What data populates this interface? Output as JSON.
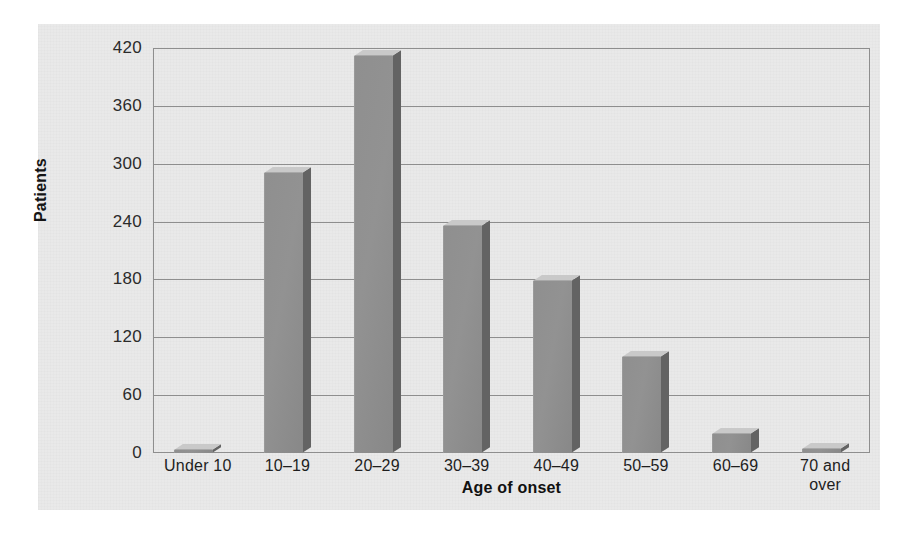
{
  "figure": {
    "caption_sliver": "",
    "background_color": "#e9e9e9",
    "page_color": "#ffffff"
  },
  "chart_data": {
    "type": "bar",
    "title": "",
    "subtitle": "",
    "xlabel": "Age of onset",
    "ylabel": "Patients",
    "categories": [
      "Under 10",
      "10–19",
      "20–29",
      "30–39",
      "40–49",
      "50–59",
      "60–69",
      "70 and over"
    ],
    "values": [
      3,
      290,
      412,
      235,
      178,
      100,
      20,
      4
    ],
    "ylim": [
      0,
      420
    ],
    "yticks": [
      0,
      60,
      120,
      180,
      240,
      300,
      360,
      420
    ],
    "ytick_labels": [
      "0",
      "60",
      "120",
      "180",
      "240",
      "300",
      "360",
      "420"
    ],
    "grid": true,
    "grid_axis": "y",
    "legend": false,
    "legend_position": "none",
    "bar_style": "3d",
    "bar_color": "#909090",
    "bar_side_color": "#636363",
    "bar_top_color": "#c9c9c9",
    "axis_color": "#8e8e8e"
  },
  "axes": {
    "y_title": "Patients",
    "x_title": "Age of onset"
  },
  "x_label_lines": [
    [
      "Under 10"
    ],
    [
      "10–19"
    ],
    [
      "20–29"
    ],
    [
      "30–39"
    ],
    [
      "40–49"
    ],
    [
      "50–59"
    ],
    [
      "60–69"
    ],
    [
      "70 and",
      "over"
    ]
  ]
}
